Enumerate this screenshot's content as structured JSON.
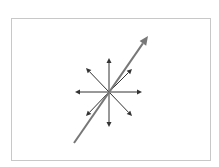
{
  "diagram": {
    "type": "vector-diagram",
    "frame": {
      "x": 11,
      "y": 18,
      "width": 201,
      "height": 144,
      "stroke": "#c8c8c8"
    },
    "center": {
      "x": 109,
      "y": 92
    },
    "small_arrows": {
      "color": "#333333",
      "stroke_width": 1,
      "tips": [
        {
          "direction": "up",
          "x": 109,
          "y": 58
        },
        {
          "direction": "down",
          "x": 109,
          "y": 127
        },
        {
          "direction": "left",
          "x": 75,
          "y": 92
        },
        {
          "direction": "right",
          "x": 142,
          "y": 92
        },
        {
          "direction": "up-left",
          "x": 86,
          "y": 68
        },
        {
          "direction": "up-right",
          "x": 132,
          "y": 69
        },
        {
          "direction": "down-left",
          "x": 86,
          "y": 116
        },
        {
          "direction": "down-right",
          "x": 132,
          "y": 116
        }
      ]
    },
    "large_arrow": {
      "color": "#777777",
      "stroke_width": 2,
      "start": {
        "x": 74,
        "y": 143
      },
      "end": {
        "x": 148,
        "y": 36
      }
    }
  }
}
